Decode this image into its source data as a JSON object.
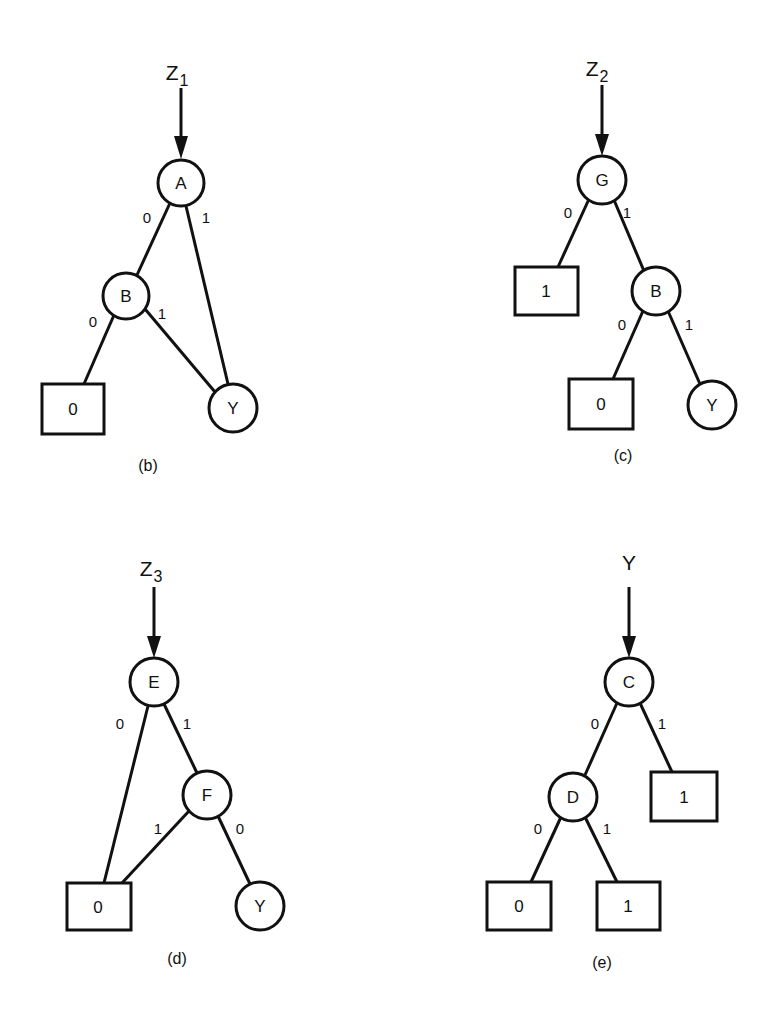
{
  "colors": {
    "stroke": "#111111",
    "background": "#ffffff"
  },
  "diagrams": [
    {
      "id": "b",
      "caption": "(b)",
      "root": {
        "label": "Z",
        "sub": "1"
      },
      "nodes": {
        "A": {
          "label": "A"
        },
        "B": {
          "label": "B"
        },
        "T0": {
          "label": "0"
        },
        "Y": {
          "label": "Y"
        }
      },
      "edges": [
        {
          "from": "A",
          "to": "B",
          "label": "0"
        },
        {
          "from": "A",
          "to": "Y",
          "label": "1"
        },
        {
          "from": "B",
          "to": "T0",
          "label": "0"
        },
        {
          "from": "B",
          "to": "Y",
          "label": "1"
        }
      ]
    },
    {
      "id": "c",
      "caption": "(c)",
      "root": {
        "label": "Z",
        "sub": "2"
      },
      "nodes": {
        "G": {
          "label": "G"
        },
        "T1": {
          "label": "1"
        },
        "B": {
          "label": "B"
        },
        "T0": {
          "label": "0"
        },
        "Y": {
          "label": "Y"
        }
      },
      "edges": [
        {
          "from": "G",
          "to": "T1",
          "label": "0"
        },
        {
          "from": "G",
          "to": "B",
          "label": "1"
        },
        {
          "from": "B",
          "to": "T0",
          "label": "0"
        },
        {
          "from": "B",
          "to": "Y",
          "label": "1"
        }
      ]
    },
    {
      "id": "d",
      "caption": "(d)",
      "root": {
        "label": "Z",
        "sub": "3"
      },
      "nodes": {
        "E": {
          "label": "E"
        },
        "F": {
          "label": "F"
        },
        "T0": {
          "label": "0"
        },
        "Y": {
          "label": "Y"
        }
      },
      "edges": [
        {
          "from": "E",
          "to": "T0",
          "label": "0"
        },
        {
          "from": "E",
          "to": "F",
          "label": "1"
        },
        {
          "from": "F",
          "to": "T0",
          "label": "1"
        },
        {
          "from": "F",
          "to": "Y",
          "label": "0"
        }
      ]
    },
    {
      "id": "e",
      "caption": "(e)",
      "root": {
        "label": "Y",
        "sub": ""
      },
      "nodes": {
        "C": {
          "label": "C"
        },
        "D": {
          "label": "D"
        },
        "T1a": {
          "label": "1"
        },
        "T0": {
          "label": "0"
        },
        "T1b": {
          "label": "1"
        }
      },
      "edges": [
        {
          "from": "C",
          "to": "D",
          "label": "0"
        },
        {
          "from": "C",
          "to": "T1a",
          "label": "1"
        },
        {
          "from": "D",
          "to": "T0",
          "label": "0"
        },
        {
          "from": "D",
          "to": "T1b",
          "label": "1"
        }
      ]
    }
  ]
}
